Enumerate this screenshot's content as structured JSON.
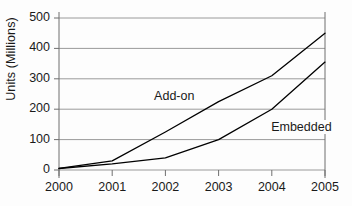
{
  "chart_data": {
    "type": "line",
    "title": "",
    "xlabel": "",
    "ylabel": "Units (Millions)",
    "categories": [
      "2000",
      "2001",
      "2002",
      "2003",
      "2004",
      "2005"
    ],
    "x": [
      2000,
      2001,
      2002,
      2003,
      2004,
      2005
    ],
    "xlim": [
      2000,
      2005
    ],
    "ylim": [
      0,
      500
    ],
    "yticks": [
      "0",
      "100",
      "200",
      "300",
      "400",
      "500"
    ],
    "ytick_values": [
      0,
      100,
      200,
      300,
      400,
      500
    ],
    "grid": "horizontal",
    "legend": "inline-annotations",
    "series": [
      {
        "name": "Add-on",
        "values": [
          5,
          30,
          125,
          225,
          310,
          450
        ],
        "color": "#000000",
        "label_x": 2001.75,
        "label_y": 240
      },
      {
        "name": "Embedded",
        "values": [
          5,
          20,
          40,
          100,
          200,
          355
        ],
        "color": "#000000",
        "label_x": 2003.95,
        "label_y": 138
      }
    ],
    "colors": {
      "background": "#fdfdfd",
      "gridline": "#9a9a9a",
      "axis": "#6f6f6f",
      "line": "#000000",
      "text": "#1a1a1a"
    }
  }
}
